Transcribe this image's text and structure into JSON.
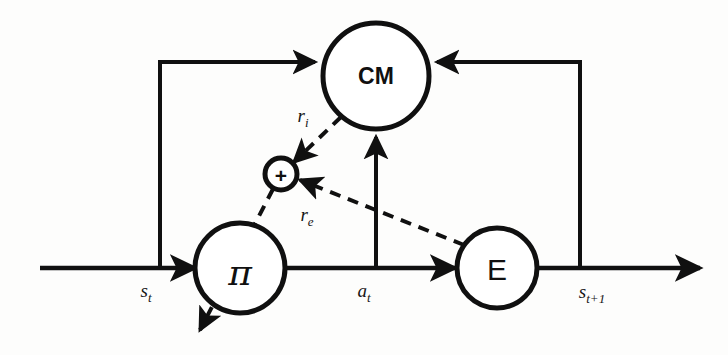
{
  "figure": {
    "background_color": "#fdfdfc",
    "stroke_color": "#101010"
  },
  "nodes": [
    {
      "id": "cm",
      "label": "CM",
      "name": "curiosity-module-node",
      "cx": 376,
      "cy": 76,
      "r": 53
    },
    {
      "id": "policy",
      "label": "π",
      "name": "policy-node",
      "cx": 240,
      "cy": 268,
      "r": 45
    },
    {
      "id": "env",
      "label": "E",
      "name": "environment-node",
      "cx": 497,
      "cy": 268,
      "r": 40
    },
    {
      "id": "sum",
      "label": "+",
      "name": "sum-node",
      "cx": 281,
      "cy": 174,
      "r": 16
    }
  ],
  "edge_labels": [
    {
      "id": "s_t",
      "base": "s",
      "sub": "t",
      "name": "state-label",
      "x": 146,
      "y": 297
    },
    {
      "id": "a_t",
      "base": "a",
      "sub": "t",
      "name": "action-label",
      "x": 364,
      "y": 297
    },
    {
      "id": "s_t1",
      "base": "s",
      "sub": "t+1",
      "name": "next-state-label",
      "x": 592,
      "y": 298
    },
    {
      "id": "r_i",
      "base": "r",
      "sub": "i",
      "name": "intrinsic-reward-label",
      "x": 303,
      "y": 122
    },
    {
      "id": "r_e",
      "base": "r",
      "sub": "e",
      "name": "extrinsic-reward-label",
      "x": 307,
      "y": 221
    }
  ],
  "edges": [
    {
      "id": "axis",
      "name": "main-timeline-axis",
      "style": "solid",
      "from": "axis-start",
      "to": "axis-end"
    },
    {
      "id": "state-to-cm",
      "name": "state-to-curiosity-edge",
      "style": "solid",
      "from": "s_t",
      "to": "cm"
    },
    {
      "id": "action-to-cm",
      "name": "action-to-curiosity-edge",
      "style": "solid",
      "from": "a_t",
      "to": "cm"
    },
    {
      "id": "nextstate-to-cm",
      "name": "next-state-to-curiosity-edge",
      "style": "solid",
      "from": "s_t1",
      "to": "cm"
    },
    {
      "id": "cm-to-sum",
      "name": "intrinsic-reward-edge",
      "style": "dashed",
      "from": "cm",
      "to": "sum"
    },
    {
      "id": "env-to-sum",
      "name": "extrinsic-reward-edge",
      "style": "dashed",
      "from": "env",
      "to": "sum"
    },
    {
      "id": "sum-to-policy",
      "name": "total-reward-to-policy-edge",
      "style": "dashed",
      "from": "sum",
      "to": "policy-output"
    }
  ]
}
